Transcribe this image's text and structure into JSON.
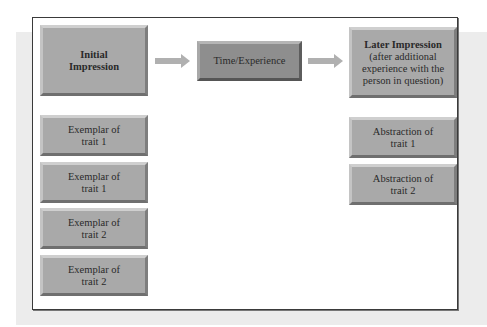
{
  "diagram": {
    "initial": {
      "title": "Initial Impression",
      "lines": [
        "Initial",
        "Impression"
      ]
    },
    "middle": {
      "label": "Time/Experience"
    },
    "later": {
      "title": "Later Impression",
      "subtitle_lines": [
        "(after additional",
        "experience with the",
        "person in question)"
      ]
    },
    "exemplars": [
      {
        "line1": "Exemplar of",
        "line2": "trait 1"
      },
      {
        "line1": "Exemplar of",
        "line2": "trait 1"
      },
      {
        "line1": "Exemplar of",
        "line2": "trait 2"
      },
      {
        "line1": "Exemplar of",
        "line2": "trait 2"
      }
    ],
    "abstractions": [
      {
        "line1": "Abstraction of",
        "line2": "trait 1"
      },
      {
        "line1": "Abstraction of",
        "line2": "trait 2"
      }
    ],
    "colors": {
      "box_fill": "#a9a9a9",
      "middle_box_fill": "#8e8e8e",
      "arrow": "#b0b0b0",
      "background_panel": "#ececec",
      "frame_border": "#3a3a3a"
    }
  }
}
